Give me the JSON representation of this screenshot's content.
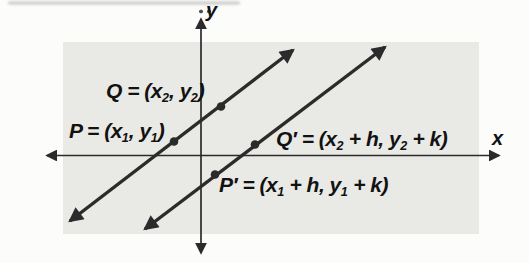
{
  "figure": {
    "axes": {
      "x_label": "x",
      "y_label": "y"
    },
    "labels": {
      "q": {
        "text": "Q = (x₂, y₂)",
        "segments": [
          {
            "t": "Q = ("
          },
          {
            "t": "x"
          },
          {
            "t": "2",
            "sub": true
          },
          {
            "t": ", "
          },
          {
            "t": "y"
          },
          {
            "t": "2",
            "sub": true
          },
          {
            "t": ")"
          }
        ]
      },
      "p": {
        "text": "P = (x₁, y₁)",
        "segments": [
          {
            "t": "P = ("
          },
          {
            "t": "x"
          },
          {
            "t": "1",
            "sub": true
          },
          {
            "t": ", "
          },
          {
            "t": "y"
          },
          {
            "t": "1",
            "sub": true
          },
          {
            "t": ")"
          }
        ]
      },
      "q_prime": {
        "text": "Q′ = (x₂ + h, y₂ + k)",
        "segments": [
          {
            "t": "Q′ = ("
          },
          {
            "t": "x"
          },
          {
            "t": "2",
            "sub": true
          },
          {
            "t": " + h, "
          },
          {
            "t": "y"
          },
          {
            "t": "2",
            "sub": true
          },
          {
            "t": " + k)"
          }
        ]
      },
      "p_prime": {
        "text": "P′ = (x₁ + h, y₁ + k)",
        "segments": [
          {
            "t": "P′ = ("
          },
          {
            "t": "x"
          },
          {
            "t": "1",
            "sub": true
          },
          {
            "t": " + h, "
          },
          {
            "t": "y"
          },
          {
            "t": "1",
            "sub": true
          },
          {
            "t": " + k)"
          }
        ]
      }
    },
    "points": [
      "P",
      "Q",
      "P′",
      "Q′"
    ],
    "colors": {
      "panel": "#e9e9e6",
      "ink": "#2b2b2b",
      "label": "#121212"
    }
  }
}
